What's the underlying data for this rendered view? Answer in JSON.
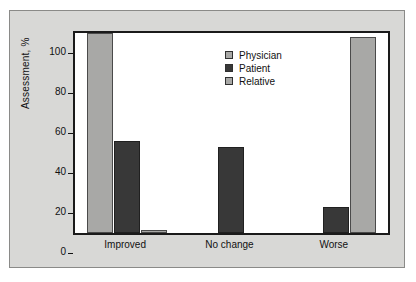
{
  "chart_data": {
    "type": "bar",
    "title": "",
    "xlabel": "",
    "ylabel": "Assessment, %",
    "ylim": [
      0,
      100
    ],
    "yticks": [
      0,
      20,
      40,
      60,
      80,
      100
    ],
    "ytick_labels": [
      "0",
      "20",
      "40",
      "60",
      "80",
      "100"
    ],
    "grid": false,
    "legend_position": "top-center",
    "categories": [
      "Improved",
      "No change",
      "Worse"
    ],
    "series": [
      {
        "name": "Physician",
        "color": "#a8a8a6",
        "values": [
          100,
          0,
          0
        ]
      },
      {
        "name": "Patient",
        "color": "#383838",
        "values": [
          46,
          43,
          13
        ]
      },
      {
        "name": "Relative",
        "color": "#a8a8a6",
        "values": [
          1.5,
          0,
          98
        ]
      }
    ]
  }
}
